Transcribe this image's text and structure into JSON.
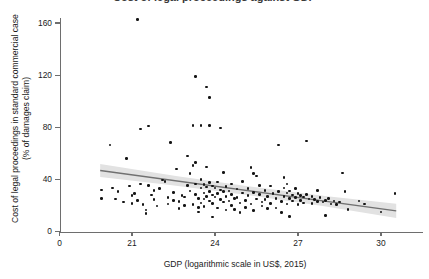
{
  "figure": {
    "title_cropped": "Cost of legal proceedings against GDP",
    "background": "#ffffff"
  },
  "axes": {
    "y": {
      "label_line1": "Cost of legal proceedings in standard commercial case",
      "label_line2": "(% of damages claim)",
      "ticks": [
        0,
        40,
        80,
        120,
        160
      ],
      "range": [
        0,
        175
      ]
    },
    "x": {
      "label": "GDP (logarithmic scale in US$, 2015)",
      "ticks": [
        0,
        21,
        24,
        27,
        30
      ],
      "range": [
        19.3,
        31.2
      ]
    }
  },
  "style": {
    "point_color": "#141414",
    "line_color": "#707070",
    "band_color": "#e2e2e2",
    "axis_color": "#6e6e6e",
    "text_color": "#1a1a1a"
  },
  "chart_data": {
    "type": "scatter",
    "title": "Cost of legal proceedings against GDP",
    "xlabel": "GDP (logarithmic scale in US$, 2015)",
    "ylabel": "Cost of legal proceedings in standard commercial case (% of damages claim)",
    "xlim": [
      19.3,
      31.2
    ],
    "ylim": [
      0,
      175
    ],
    "xticks": [
      0,
      21,
      24,
      27,
      30
    ],
    "yticks": [
      0,
      40,
      80,
      120,
      160
    ],
    "grid": false,
    "legend": null,
    "series": [
      {
        "name": "Countries",
        "marker": "filled-circle",
        "color": "#141414",
        "points": [
          [
            19.9,
            32.0
          ],
          [
            19.9,
            25.5
          ],
          [
            20.2,
            66.5
          ],
          [
            20.3,
            33.5
          ],
          [
            20.4,
            25.0
          ],
          [
            20.5,
            30.5
          ],
          [
            20.7,
            22.5
          ],
          [
            20.8,
            56.0
          ],
          [
            20.9,
            35.0
          ],
          [
            21.0,
            27.5
          ],
          [
            21.0,
            21.5
          ],
          [
            21.2,
            162.5
          ],
          [
            21.1,
            29.0
          ],
          [
            21.2,
            24.0
          ],
          [
            21.3,
            78.5
          ],
          [
            21.3,
            36.5
          ],
          [
            21.4,
            20.5
          ],
          [
            21.5,
            16.5
          ],
          [
            21.5,
            14.0
          ],
          [
            21.6,
            81.0
          ],
          [
            21.6,
            35.5
          ],
          [
            21.7,
            28.0
          ],
          [
            21.8,
            24.5
          ],
          [
            21.8,
            31.5
          ],
          [
            21.9,
            19.5
          ],
          [
            22.0,
            33.0
          ],
          [
            22.1,
            39.5
          ],
          [
            22.2,
            38.5
          ],
          [
            22.3,
            26.0
          ],
          [
            22.3,
            21.0
          ],
          [
            22.4,
            68.5
          ],
          [
            22.5,
            30.0
          ],
          [
            22.5,
            24.0
          ],
          [
            22.6,
            48.0
          ],
          [
            22.7,
            17.5
          ],
          [
            22.7,
            23.0
          ],
          [
            22.8,
            27.5
          ],
          [
            22.9,
            20.0
          ],
          [
            22.9,
            26.5
          ],
          [
            23.0,
            58.0
          ],
          [
            23.0,
            35.5
          ],
          [
            23.1,
            44.5
          ],
          [
            23.1,
            31.0
          ],
          [
            23.2,
            81.5
          ],
          [
            23.2,
            50.5
          ],
          [
            23.2,
            20.5
          ],
          [
            23.3,
            119.0
          ],
          [
            23.3,
            53.0
          ],
          [
            23.3,
            36.5
          ],
          [
            23.3,
            28.5
          ],
          [
            23.4,
            25.5
          ],
          [
            23.4,
            18.5
          ],
          [
            23.4,
            15.0
          ],
          [
            23.5,
            81.5
          ],
          [
            23.5,
            40.0
          ],
          [
            23.5,
            33.5
          ],
          [
            23.5,
            22.0
          ],
          [
            23.6,
            36.0
          ],
          [
            23.6,
            29.5
          ],
          [
            23.6,
            25.0
          ],
          [
            23.6,
            19.0
          ],
          [
            23.7,
            111.0
          ],
          [
            23.7,
            49.5
          ],
          [
            23.7,
            34.0
          ],
          [
            23.7,
            27.0
          ],
          [
            23.8,
            103.0
          ],
          [
            23.8,
            81.5
          ],
          [
            23.8,
            37.5
          ],
          [
            23.8,
            30.5
          ],
          [
            23.8,
            23.5
          ],
          [
            23.9,
            35.0
          ],
          [
            23.9,
            28.0
          ],
          [
            23.9,
            21.5
          ],
          [
            23.9,
            11.0
          ],
          [
            24.0,
            33.5
          ],
          [
            24.0,
            26.5
          ],
          [
            24.1,
            38.0
          ],
          [
            24.1,
            29.0
          ],
          [
            24.1,
            18.0
          ],
          [
            24.2,
            79.5
          ],
          [
            24.2,
            32.0
          ],
          [
            24.2,
            24.5
          ],
          [
            24.3,
            45.5
          ],
          [
            24.3,
            30.5
          ],
          [
            24.3,
            22.5
          ],
          [
            24.4,
            34.5
          ],
          [
            24.4,
            27.0
          ],
          [
            24.4,
            16.5
          ],
          [
            24.5,
            31.0
          ],
          [
            24.5,
            23.5
          ],
          [
            24.6,
            36.5
          ],
          [
            24.6,
            28.5
          ],
          [
            24.6,
            20.0
          ],
          [
            24.7,
            25.5
          ],
          [
            24.7,
            17.0
          ],
          [
            24.8,
            32.5
          ],
          [
            24.8,
            26.0
          ],
          [
            24.9,
            22.0
          ],
          [
            24.9,
            14.5
          ],
          [
            25.0,
            38.5
          ],
          [
            25.0,
            29.5
          ],
          [
            25.1,
            24.0
          ],
          [
            25.1,
            18.5
          ],
          [
            25.2,
            33.0
          ],
          [
            25.2,
            27.5
          ],
          [
            25.3,
            49.0
          ],
          [
            25.3,
            21.0
          ],
          [
            25.4,
            44.5
          ],
          [
            25.4,
            30.0
          ],
          [
            25.4,
            16.0
          ],
          [
            25.5,
            42.5
          ],
          [
            25.5,
            25.0
          ],
          [
            25.6,
            35.5
          ],
          [
            25.6,
            28.5
          ],
          [
            25.7,
            22.5
          ],
          [
            25.7,
            19.5
          ],
          [
            25.8,
            31.5
          ],
          [
            25.8,
            24.5
          ],
          [
            25.9,
            27.0
          ],
          [
            25.9,
            17.5
          ],
          [
            26.0,
            35.0
          ],
          [
            26.0,
            21.5
          ],
          [
            26.1,
            29.0
          ],
          [
            26.2,
            25.5
          ],
          [
            26.2,
            18.0
          ],
          [
            26.3,
            66.5
          ],
          [
            26.3,
            30.5
          ],
          [
            26.4,
            23.0
          ],
          [
            26.4,
            14.5
          ],
          [
            26.5,
            41.5
          ],
          [
            26.5,
            33.5
          ],
          [
            26.5,
            27.0
          ],
          [
            26.6,
            36.5
          ],
          [
            26.6,
            29.5
          ],
          [
            26.6,
            21.0
          ],
          [
            26.7,
            31.0
          ],
          [
            26.7,
            25.5
          ],
          [
            26.7,
            11.5
          ],
          [
            26.8,
            28.0
          ],
          [
            26.8,
            23.5
          ],
          [
            26.9,
            33.0
          ],
          [
            26.9,
            26.0
          ],
          [
            27.0,
            29.0
          ],
          [
            27.0,
            20.5
          ],
          [
            27.1,
            27.5
          ],
          [
            27.1,
            24.0
          ],
          [
            27.2,
            26.5
          ],
          [
            27.2,
            22.0
          ],
          [
            27.3,
            69.5
          ],
          [
            27.3,
            28.5
          ],
          [
            27.4,
            25.0
          ],
          [
            27.5,
            27.0
          ],
          [
            27.5,
            21.5
          ],
          [
            27.6,
            24.5
          ],
          [
            27.7,
            31.5
          ],
          [
            27.7,
            23.0
          ],
          [
            27.8,
            26.0
          ],
          [
            27.9,
            22.5
          ],
          [
            28.0,
            24.0
          ],
          [
            28.0,
            12.5
          ],
          [
            28.1,
            25.5
          ],
          [
            28.2,
            21.0
          ],
          [
            28.3,
            23.5
          ],
          [
            28.4,
            20.5
          ],
          [
            28.5,
            22.5
          ],
          [
            28.6,
            45.0
          ],
          [
            28.7,
            30.5
          ],
          [
            28.8,
            17.0
          ],
          [
            29.2,
            23.5
          ],
          [
            29.4,
            21.0
          ],
          [
            30.0,
            15.0
          ],
          [
            30.5,
            29.0
          ]
        ]
      }
    ],
    "fit": {
      "name": "Linear fit with confidence band",
      "line_color": "#707070",
      "band_color": "#e2e2e2",
      "x_start": 19.85,
      "x_end": 30.55,
      "y_start": 46.8,
      "y_end": 15.8,
      "band_halfwidth_start": 5.0,
      "band_halfwidth_mid": 1.6,
      "band_halfwidth_end": 5.4
    }
  }
}
